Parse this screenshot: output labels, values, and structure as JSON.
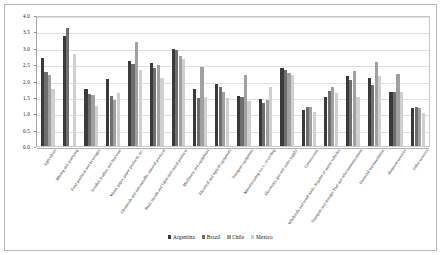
{
  "chart_data": {
    "type": "bar",
    "title": "",
    "subtitle": "",
    "xlabel": "",
    "ylabel": "",
    "ylim": [
      0.0,
      4.0
    ],
    "ytick_step": 0.5,
    "grid": true,
    "legend_position": "bottom",
    "ytick_labels": [
      "0.0",
      "0.5",
      "1.0",
      "1.5",
      "2.0",
      "2.5",
      "3.0",
      "3.5",
      "4.0"
    ],
    "categories": [
      "Agriculture",
      "Mining and quarrying",
      "Food products and beverages",
      "Textiles, leather, and footwear",
      "Wood, paper, paper products, etc.",
      "Chemicals and non-metallic mineral products",
      "Basic metals and fabricated metal products",
      "Machinery and equipment",
      "Electrical and optical equipment",
      "Transport equipment",
      "Manufacturing n.e.c.; recycling",
      "Electricity, gas and water supply",
      "Construction",
      "Wholesale and retail trade; Repairs of motor vehicles",
      "Transport and storage; Post and telecommunications",
      "Financial intermediation",
      "Business services",
      "Other services"
    ],
    "series": [
      {
        "name": "Argentina",
        "color": "#3a3a3a",
        "values": [
          2.7,
          3.35,
          1.75,
          2.06,
          2.59,
          2.55,
          2.96,
          1.75,
          1.89,
          1.54,
          1.43,
          2.39,
          1.1,
          1.5,
          2.13,
          2.09,
          1.66,
          1.16
        ]
      },
      {
        "name": "Brazil",
        "color": "#6e6e6e",
        "values": [
          2.25,
          3.6,
          1.58,
          1.53,
          2.49,
          2.39,
          2.92,
          1.46,
          1.8,
          1.5,
          1.3,
          2.33,
          1.2,
          1.67,
          2.02,
          1.85,
          1.66,
          1.18
        ]
      },
      {
        "name": "Chile",
        "color": "#a0a0a0",
        "values": [
          2.18,
          0.0,
          1.56,
          1.4,
          3.17,
          2.46,
          2.75,
          2.4,
          1.66,
          2.17,
          1.41,
          2.24,
          1.2,
          1.8,
          2.29,
          2.57,
          2.21,
          1.17
        ]
      },
      {
        "name": "Mexico",
        "color": "#cfcfcf",
        "values": [
          1.73,
          2.8,
          1.22,
          1.63,
          2.31,
          2.09,
          2.65,
          1.5,
          1.47,
          1.37,
          1.8,
          2.16,
          1.05,
          1.62,
          1.5,
          2.15,
          1.66,
          1.02
        ]
      }
    ]
  },
  "legend": {
    "items": [
      {
        "label": "Argentina"
      },
      {
        "label": "Brazil"
      },
      {
        "label": "Chile"
      },
      {
        "label": "Mexico"
      }
    ]
  }
}
